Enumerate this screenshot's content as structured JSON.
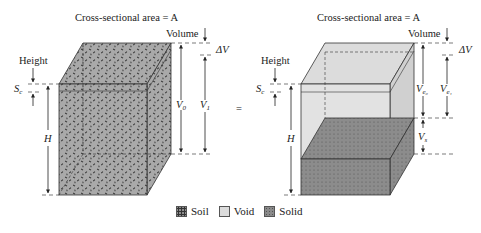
{
  "left_box": {
    "title": "Cross-sectional area = A",
    "volume_label": "Volume",
    "delta_v": "ΔV",
    "height_label": "Height",
    "sc_label": "S",
    "sc_sub": "c",
    "h_label": "H",
    "v0_label": "V",
    "v0_sub": "0",
    "v1_label": "V",
    "v1_sub": "1"
  },
  "equals": "=",
  "right_box": {
    "title": "Cross-sectional area = A",
    "volume_label": "Volume",
    "delta_v": "ΔV",
    "height_label": "Height",
    "sc_label": "S",
    "sc_sub": "c",
    "h_label": "H",
    "ve0_label": "V",
    "ve0_sub": "e₀",
    "ve1_label": "V",
    "ve1_sub": "e₁",
    "vs_label": "V",
    "vs_sub": "s"
  },
  "legend": [
    {
      "label": "Soil",
      "swatch": "soil"
    },
    {
      "label": "Void",
      "swatch": "void"
    },
    {
      "label": "Solid",
      "swatch": "solid"
    }
  ],
  "colors": {
    "soil": "#a9a9a9",
    "void": "#dcdcdc",
    "solid": "#8c8c8c",
    "line": "#333333"
  }
}
